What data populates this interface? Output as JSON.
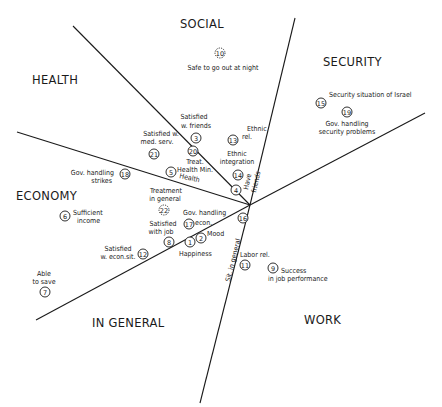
{
  "regions": {
    "social": "SOCIAL",
    "security": "SECURITY",
    "health": "HEALTH",
    "economy": "ECONOMY",
    "in_general": "IN GENERAL",
    "work": "WORK"
  },
  "items": {
    "i1": {
      "num": "1",
      "label": "Happiness"
    },
    "i2": {
      "num": "2",
      "label": "Mood"
    },
    "i3": {
      "num": "3",
      "label1": "Satisfied",
      "label2": "w. friends"
    },
    "i4": {
      "num": "4",
      "label1": "Have",
      "label2": "friends"
    },
    "i5": {
      "num": "5",
      "label": "Health"
    },
    "i6": {
      "num": "6",
      "label1": "Sufficient",
      "label2": "income"
    },
    "i7": {
      "num": "7",
      "label1": "Able",
      "label2": "to save"
    },
    "i8": {
      "num": "8",
      "label1": "Satisfied",
      "label2": "with job"
    },
    "i9": {
      "num": "9",
      "label1": "Success",
      "label2": "in job performance"
    },
    "i10": {
      "num": "10",
      "label": "Safe to go out at night"
    },
    "i11": {
      "num": "11",
      "label": "Labor rel."
    },
    "i12": {
      "num": "12",
      "label1": "Satisfied",
      "label2": "w. econ.sit."
    },
    "i13": {
      "num": "13",
      "label1": "Ethnic",
      "label2": "rel."
    },
    "i14": {
      "num": "14",
      "label1": "Ethnic",
      "label2": "integration"
    },
    "i16": {
      "num": "16",
      "label": "Sit. in general"
    },
    "i15": {
      "num": "15",
      "label": "Security situation of Israel"
    },
    "i17": {
      "num": "17",
      "label1": "Gov. handling",
      "label2": "econ."
    },
    "i18": {
      "num": "18",
      "label1": "Gov. handling",
      "label2": "strikes"
    },
    "i19": {
      "num": "19",
      "label1": "Gov. handling",
      "label2": "security problems"
    },
    "i20": {
      "num": "20",
      "label1": "Treat.",
      "label2": "Health Min."
    },
    "i21": {
      "num": "21",
      "label1": "Satisfied w.",
      "label2": "med. serv."
    },
    "i22": {
      "num": "22",
      "label1": "Treatment",
      "label2": "in general"
    }
  }
}
